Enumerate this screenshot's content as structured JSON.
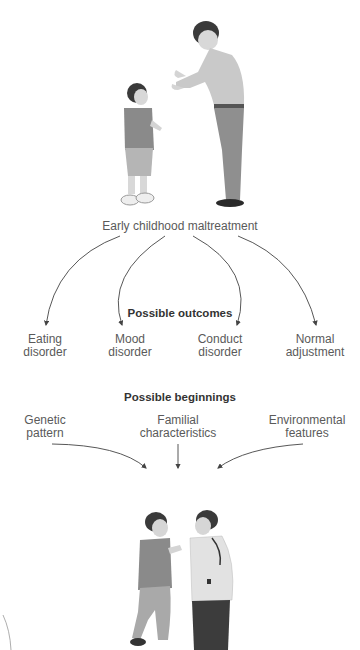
{
  "diagram": {
    "top_caption": "Early childhood maltreatment",
    "outcomes_heading": "Possible outcomes",
    "outcomes": [
      {
        "line1": "Eating",
        "line2": "disorder"
      },
      {
        "line1": "Mood",
        "line2": "disorder"
      },
      {
        "line1": "Conduct",
        "line2": "disorder"
      },
      {
        "line1": "Normal",
        "line2": "adjustment"
      }
    ],
    "beginnings_heading": "Possible beginnings",
    "beginnings": [
      {
        "line1": "Genetic",
        "line2": "pattern"
      },
      {
        "line1": "Familial",
        "line2": "characteristics"
      },
      {
        "line1": "Environmental",
        "line2": "features"
      }
    ],
    "illustrations": {
      "top": "adult-scolding-child-illustration",
      "bottom": "two-boys-confrontation-illustration"
    },
    "colors": {
      "arrow": "#444444",
      "text": "#5a5a5a",
      "heading": "#333333",
      "figure_light": "#c8c8c8",
      "figure_dark": "#555555"
    }
  }
}
